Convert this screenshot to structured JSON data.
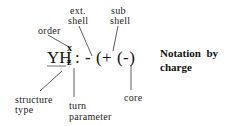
{
  "diagram": {
    "title_line1": "Notation  by",
    "title_line2": "charge",
    "formula": {
      "base": "YH",
      "superscript": "x",
      "subscript": "z",
      "rest": ": - (+ (-)"
    },
    "labels": {
      "ext_line1": "ext.",
      "ext_line2": "shell",
      "sub_line1": "sub",
      "sub_line2": "shell",
      "order": "order",
      "structure_line1": "structure",
      "structure_line2": "type",
      "turn_line1": "turn",
      "turn_line2": "parameter",
      "core": "core"
    },
    "colors": {
      "ink": "#1a1a1a",
      "background": "#ffffff"
    }
  }
}
